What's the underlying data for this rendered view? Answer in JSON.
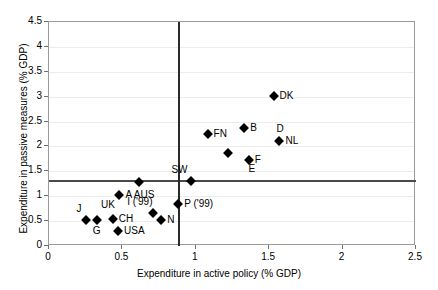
{
  "chart_data": {
    "type": "scatter",
    "title": "",
    "xlabel": "Expenditure in active policy (% GDP)",
    "ylabel": "Expenditure in passive measures (% GDP)",
    "xlim": [
      0,
      2.5
    ],
    "ylim": [
      0,
      4.5
    ],
    "xticks": [
      "0",
      "0.5",
      "1",
      "1.5",
      "2",
      "2.5"
    ],
    "xtick_values": [
      0,
      0.5,
      1,
      1.5,
      2,
      2.5
    ],
    "yticks": [
      "0",
      "0.5",
      "1",
      "1.5",
      "2",
      "2.5",
      "3",
      "3.5",
      "4",
      "4.5"
    ],
    "ytick_values": [
      0,
      0.5,
      1,
      1.5,
      2,
      2.5,
      3,
      3.5,
      4,
      4.5
    ],
    "grid": true,
    "legend": "none",
    "reference_lines": [
      {
        "orientation": "horizontal",
        "value": 1.3
      },
      {
        "orientation": "vertical",
        "value": 0.885
      }
    ],
    "points": [
      {
        "label": "DK",
        "x": 1.53,
        "y": 3.01,
        "label_pos": "right"
      },
      {
        "label": "B",
        "x": 1.33,
        "y": 2.37,
        "label_pos": "right"
      },
      {
        "label": "FN",
        "x": 1.08,
        "y": 2.26,
        "label_pos": "right"
      },
      {
        "label": "NL",
        "x": 1.57,
        "y": 2.1,
        "label_pos": "right"
      },
      {
        "label": "D",
        "x": 1.57,
        "y": 2.1,
        "label_pos": "above"
      },
      {
        "label": "",
        "x": 1.22,
        "y": 1.87,
        "label_pos": "none"
      },
      {
        "label": "F",
        "x": 1.36,
        "y": 1.73,
        "label_pos": "right"
      },
      {
        "label": "SW",
        "x": 0.97,
        "y": 1.31,
        "label_pos": "above-left"
      },
      {
        "label": "E",
        "x": 1.38,
        "y": 1.31,
        "label_pos": "above"
      },
      {
        "label": "",
        "x": 0.61,
        "y": 1.29,
        "label_pos": "none"
      },
      {
        "label": "A AUS",
        "x": 0.48,
        "y": 1.02,
        "label_pos": "right"
      },
      {
        "label": "P ('99)",
        "x": 0.88,
        "y": 0.84,
        "label_pos": "right"
      },
      {
        "label": "I ('99)",
        "x": 0.71,
        "y": 0.66,
        "label_pos": "above-left"
      },
      {
        "label": "UK",
        "x": 0.375,
        "y": 0.59,
        "label_pos": "above"
      },
      {
        "label": "CH",
        "x": 0.435,
        "y": 0.55,
        "label_pos": "right"
      },
      {
        "label": "J",
        "x": 0.255,
        "y": 0.53,
        "label_pos": "above-left"
      },
      {
        "label": "G",
        "x": 0.325,
        "y": 0.53,
        "label_pos": "below"
      },
      {
        "label": "N",
        "x": 0.765,
        "y": 0.53,
        "label_pos": "right"
      },
      {
        "label": "USA",
        "x": 0.47,
        "y": 0.31,
        "label_pos": "right"
      }
    ]
  }
}
